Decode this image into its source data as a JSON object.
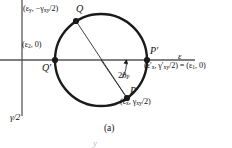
{
  "figure": {
    "caption": "(a)",
    "ghost_glyph": "y",
    "axes": {
      "horizontal_label": "ε",
      "vertical_label": "γ/2"
    },
    "points": [
      {
        "id": "Q",
        "name": "Q",
        "coord_label": "(εy, −γxy/2)",
        "coord_parts": {
          "first": "ε",
          "first_sub": "y",
          "second": "−γ",
          "second_sub": "xy",
          "second_tail": "/2"
        },
        "x": 76,
        "y": 21
      },
      {
        "id": "Qprime",
        "name": "Q′",
        "coord_label": "(ε2, 0)",
        "x": 55,
        "y": 60
      },
      {
        "id": "Pprime",
        "name": "P′",
        "coord_label": "(ε′x, γ′xy/2) = (ε1, 0)",
        "x": 147,
        "y": 60
      },
      {
        "id": "P",
        "name": "P",
        "coord_label": "(εx, γxy/2)",
        "x": 127,
        "y": 98
      }
    ],
    "angle": {
      "label": "2θP",
      "label_main": "2θ",
      "label_sub": "P",
      "value_deg": 56
    },
    "circle": {
      "center_x": 101,
      "center_y": 60,
      "radius": 46
    },
    "colors": {
      "stroke": "#1a1a1a",
      "axis": "#555555",
      "background": "#ffffff",
      "ghost": "#b9b9b9"
    }
  }
}
